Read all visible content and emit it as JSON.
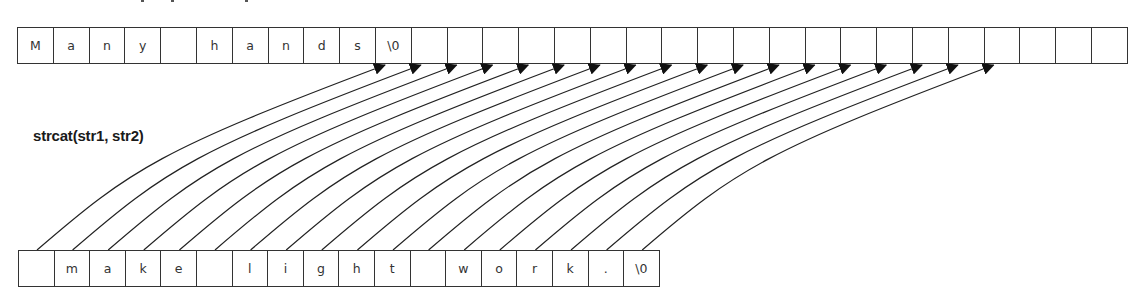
{
  "diagram": {
    "label": "strcat(str1, str2)",
    "top_array": {
      "name": "str1",
      "cell_width": 35.8,
      "cells": [
        "M",
        "a",
        "n",
        "y",
        " ",
        "h",
        "a",
        "n",
        "d",
        "s",
        "\\0",
        "",
        "",
        "",
        "",
        "",
        "",
        "",
        "",
        "",
        "",
        "",
        "",
        "",
        "",
        "",
        "",
        "",
        "",
        "",
        ""
      ]
    },
    "bottom_array": {
      "name": "str2",
      "cell_width": 35.6,
      "cells": [
        " ",
        "m",
        "a",
        "k",
        "e",
        " ",
        "l",
        "i",
        "g",
        "h",
        "t",
        " ",
        "w",
        "o",
        "r",
        "k",
        ".",
        "\\0"
      ]
    },
    "arrows": {
      "count": 18,
      "from_bottom_start_index": 0,
      "to_top_start_index": 10,
      "color": "#222222",
      "head": "filled-triangle"
    }
  }
}
